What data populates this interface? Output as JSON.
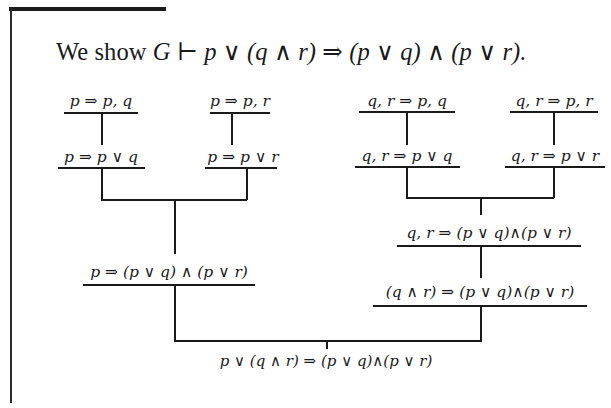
{
  "page": {
    "heading": {
      "prefix": "We show ",
      "formula": "G ⊢ p ∨ (q ∧ r) ⇒ (p ∨ q) ∧ (p ∨ r)."
    }
  },
  "proof_tree": {
    "left_branch": {
      "leaf_1": "p ⇒ p, q",
      "leaf_2": "p ⇒ p, r",
      "step_1": "p ⇒ p ∨ q",
      "step_2": "p ⇒ p ∨ r",
      "conclusion": "p ⇒ (p ∨ q) ∧ (p ∨ r)"
    },
    "right_branch": {
      "leaf_1": "q, r ⇒ p, q",
      "leaf_2": "q, r ⇒ p, r",
      "step_1": "q, r ⇒ p ∨ q",
      "step_2": "q, r ⇒ p ∨ r",
      "combined": "q, r ⇒ (p ∨ q)∧(p ∨ r)",
      "conclusion": "(q ∧ r) ⇒ (p ∨ q)∧(p ∨ r)"
    },
    "root": "p ∨ (q ∧ r) ⇒ (p ∨ q)∧(p ∨ r)"
  }
}
